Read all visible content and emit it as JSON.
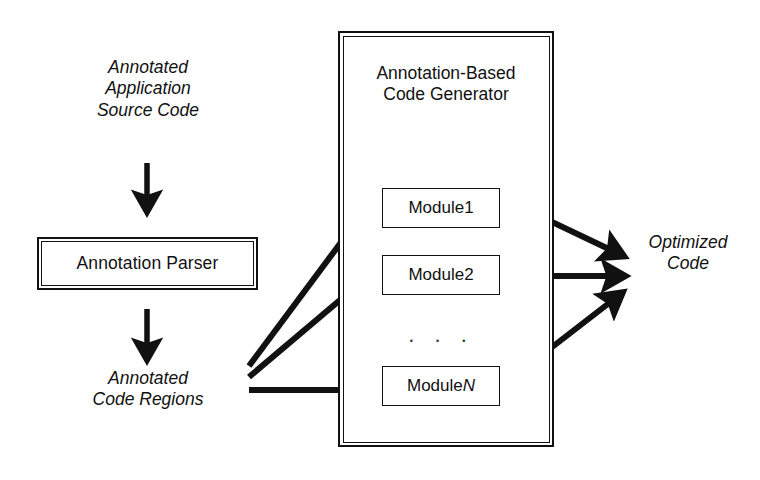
{
  "diagram": {
    "background_color": "#ffffff",
    "line_color": "#111111",
    "nodes": {
      "source_code": {
        "label": "Annotated\nApplication\nSource Code",
        "style": "italic",
        "shape": "text"
      },
      "annotation_parser": {
        "label": "Annotation Parser",
        "style": "upright",
        "shape": "double-border-box"
      },
      "code_regions": {
        "label": "Annotated\nCode Regions",
        "style": "italic",
        "shape": "text"
      },
      "generator_panel": {
        "label": "Annotation-Based\nCode Generator",
        "style": "upright",
        "shape": "double-border-panel"
      },
      "optimized_code": {
        "label": "Optimized\nCode",
        "style": "italic",
        "shape": "text"
      }
    },
    "modules": [
      {
        "name": "module-1",
        "label_prefix": "Module ",
        "label_suffix": "1",
        "suffix_italic": false
      },
      {
        "name": "module-2",
        "label_prefix": "Module ",
        "label_suffix": "2",
        "suffix_italic": false
      },
      {
        "name": "module-n",
        "label_prefix": "Module ",
        "label_suffix": "N",
        "suffix_italic": true
      }
    ],
    "ellipsis": ". . .",
    "edges": [
      {
        "name": "source-to-parser",
        "from": "source_code",
        "to": "annotation_parser",
        "direction": "down"
      },
      {
        "name": "parser-to-regions",
        "from": "annotation_parser",
        "to": "code_regions",
        "direction": "down"
      },
      {
        "name": "regions-to-module-1",
        "from": "code_regions",
        "to": "module-1",
        "direction": "up-right"
      },
      {
        "name": "regions-to-module-2",
        "from": "code_regions",
        "to": "module-2",
        "direction": "up-right"
      },
      {
        "name": "regions-to-module-n",
        "from": "code_regions",
        "to": "module-n",
        "direction": "right"
      },
      {
        "name": "module-1-to-optimized",
        "from": "module-1",
        "to": "optimized_code",
        "direction": "down-right"
      },
      {
        "name": "module-2-to-optimized",
        "from": "module-2",
        "to": "optimized_code",
        "direction": "right"
      },
      {
        "name": "module-n-to-optimized",
        "from": "module-n",
        "to": "optimized_code",
        "direction": "up-right"
      }
    ]
  }
}
